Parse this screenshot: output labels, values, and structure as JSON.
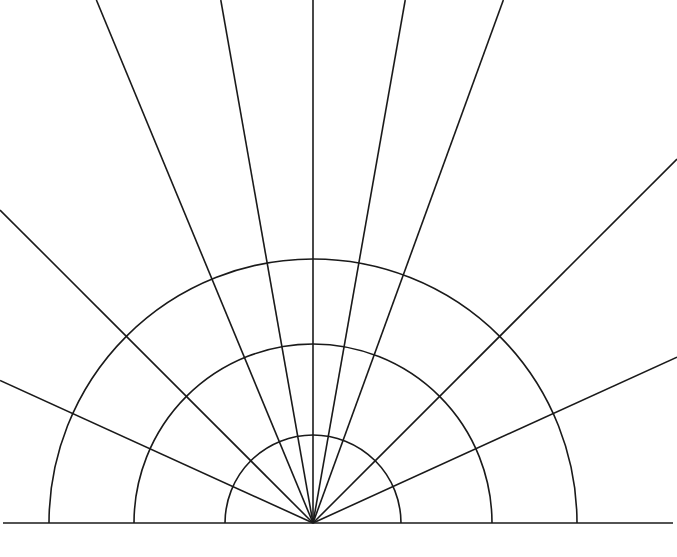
{
  "figure": {
    "type": "polar-grid-diagram",
    "background_color": "#ffffff",
    "stroke_color": "#1a1a1a",
    "stroke_width": 1.6,
    "canvas": {
      "width": 677,
      "height": 557
    }
  },
  "chart_data": {
    "type": "line",
    "subtitle": "",
    "xlabel": "",
    "ylabel": "",
    "grid": true,
    "legend": "none",
    "projection": "polar-half",
    "origin": {
      "x": 313,
      "y": 523
    },
    "baseline": {
      "label": "horizon-baseline",
      "x_start": 3,
      "x_end": 673,
      "y": 523
    },
    "radial_gridlines": {
      "label": "concentric-arcs",
      "count": 3,
      "radii": [
        88,
        179,
        264
      ],
      "theta_start_deg": 0,
      "theta_end_deg": 180
    },
    "angular_gridlines": {
      "label": "rays",
      "count": 9,
      "unit": "degrees-ccw-from-positive-x-axis",
      "angles_deg": [
        24.5,
        45.0,
        70.0,
        80.0,
        90.0,
        100.0,
        112.5,
        135.0,
        155.5
      ],
      "clipped_to_canvas": true
    },
    "xlim": [
      0,
      677
    ],
    "ylim": [
      0,
      557
    ]
  }
}
